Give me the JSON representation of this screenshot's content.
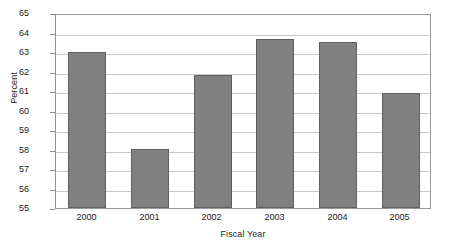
{
  "chart_data": {
    "type": "bar",
    "title": "",
    "subtitle": "",
    "xlabel": "Fiscal Year",
    "ylabel": "Percent",
    "categories": [
      "2000",
      "2001",
      "2002",
      "2003",
      "2004",
      "2005"
    ],
    "values": [
      63.0,
      58.0,
      61.8,
      63.65,
      63.5,
      60.9
    ],
    "series": [
      {
        "name": "Percent",
        "values": [
          63.0,
          58.0,
          61.8,
          63.65,
          63.5,
          60.9
        ]
      }
    ],
    "ylim": [
      55,
      65
    ],
    "ytick_labels": [
      "65",
      "64",
      "63",
      "62",
      "61",
      "60",
      "59",
      "58",
      "57",
      "56",
      "55"
    ],
    "ytick_values": [
      65,
      64,
      63,
      62,
      61,
      60,
      59,
      58,
      57,
      56,
      55
    ],
    "grid": true,
    "grid_axis": "y",
    "legend": false,
    "legend_position": "none",
    "bar_color": "#808080",
    "bar_border_color": "#5e5e5e",
    "grid_color": "#c9c9c9",
    "axis_color": "#9a9a9a",
    "plot_background": "#ffffff",
    "text_color": "#1a1a1a"
  }
}
